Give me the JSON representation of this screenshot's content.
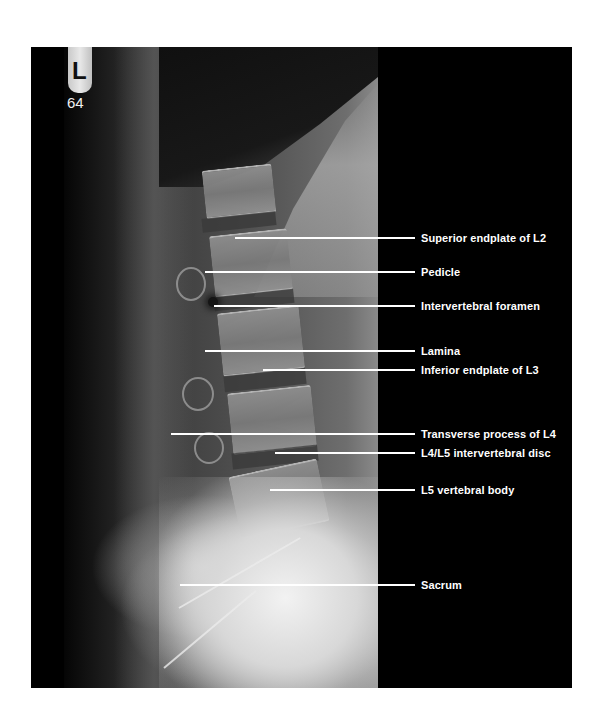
{
  "figure": {
    "type": "lateral lumbar spine radiograph",
    "marker": {
      "letter": "L",
      "number": "64"
    },
    "colors": {
      "background": "#000000",
      "label_text": "#ffffff",
      "leader_line": "#ffffff",
      "page": "#ffffff"
    }
  },
  "annotations": [
    {
      "id": "superior-endplate-l2",
      "label": "Superior endplate of L2",
      "line_y": 238,
      "line_x_start": 235
    },
    {
      "id": "pedicle",
      "label": "Pedicle",
      "line_y": 272,
      "line_x_start": 205
    },
    {
      "id": "intervertebral-foramen",
      "label": "Intervertebral foramen",
      "line_y": 306,
      "line_x_start": 214
    },
    {
      "id": "lamina",
      "label": "Lamina",
      "line_y": 351,
      "line_x_start": 205
    },
    {
      "id": "inferior-endplate-l3",
      "label": "Inferior endplate of L3",
      "line_y": 370,
      "line_x_start": 263
    },
    {
      "id": "transverse-process-l4",
      "label": "Transverse process of L4",
      "line_y": 434,
      "line_x_start": 171
    },
    {
      "id": "l4-l5-disc",
      "label": "L4/L5 intervertebral disc",
      "line_y": 453,
      "line_x_start": 275
    },
    {
      "id": "l5-vertebral-body",
      "label": "L5 vertebral body",
      "line_y": 490,
      "line_x_start": 270
    },
    {
      "id": "sacrum",
      "label": "Sacrum",
      "line_y": 585,
      "line_x_start": 180
    }
  ]
}
